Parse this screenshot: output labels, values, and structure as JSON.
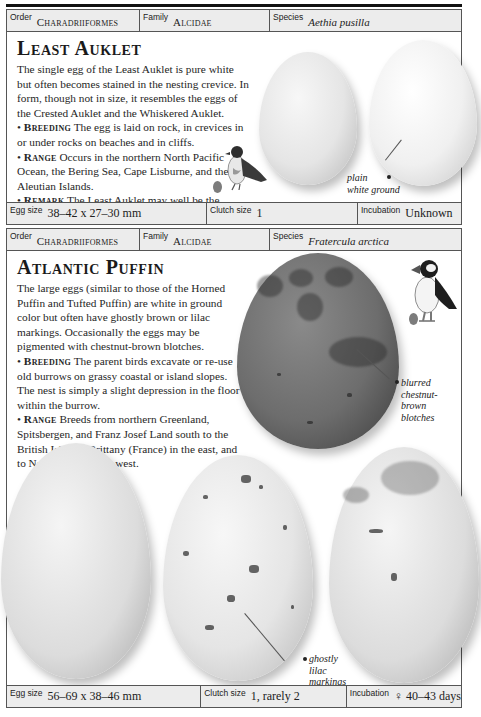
{
  "entries": [
    {
      "order_label": "Order",
      "order": "Charadriiformes",
      "family_label": "Family",
      "family": "Alcidae",
      "species_label": "Species",
      "species": "Aethia pusilla",
      "title": "Least Auklet",
      "intro": "The single egg of the Least Auklet is pure white but often becomes stained in the nesting crevice. In form, though not in size, it resembles the eggs of the Crested Auklet and the Whiskered Auklet.",
      "sections": [
        {
          "keyword": "Breeding",
          "text": "The egg is laid on rock, in crevices in or under rocks on beaches and in cliffs."
        },
        {
          "keyword": "Range",
          "text": "Occurs in the northern North Pacific Ocean, the Bering Sea, Cape Lisburne, and the Aleutian Islands."
        },
        {
          "keyword": "Remark",
          "text": "The Least Auklet may well be the smallest of all seabirds."
        }
      ],
      "annotations": [
        {
          "line1": "plain",
          "line2": "white ground"
        }
      ],
      "egg_size_label": "Egg size",
      "egg_size": "38–42 x 27–30 mm",
      "clutch_size_label": "Clutch size",
      "clutch_size": "1",
      "incubation_label": "Incubation",
      "incubation": "Unknown"
    },
    {
      "order_label": "Order",
      "order": "Charadriiformes",
      "family_label": "Family",
      "family": "Alcidae",
      "species_label": "Species",
      "species": "Fratercula arctica",
      "title": "Atlantic Puffin",
      "intro": "The large eggs (similar to those of the Horned Puffin and Tufted Puffin) are white in ground color but often have ghostly brown or lilac markings. Occasionally the eggs may be pigmented with chestnut-brown blotches.",
      "sections": [
        {
          "keyword": "Breeding",
          "text": "The parent birds excavate or re-use old burrows on grassy coastal or island slopes. The nest is simply a slight depression in the floor within the burrow."
        },
        {
          "keyword": "Range",
          "text": "Breeds from northern Greenland, Spitsbergen, and Franz Josef Land south to the British Isles, to Brittany (France) in the east, and to Nova Scotia in the west."
        }
      ],
      "annotations": [
        {
          "line1": "blurred",
          "line2": "chestnut-",
          "line3": "brown",
          "line4": "blotches"
        },
        {
          "line1": "ghostly",
          "line2": "lilac",
          "line3": "markings"
        }
      ],
      "egg_size_label": "Egg size",
      "egg_size": "56–69 x 38–46 mm",
      "clutch_size_label": "Clutch size",
      "clutch_size": "1, rarely 2",
      "incubation_label": "Incubation",
      "incubation": "♀ 40–43 days"
    }
  ],
  "icons": {
    "bird_1": "least-auklet-illustration",
    "bird_2": "atlantic-puffin-illustration",
    "bullet": "•"
  },
  "colors": {
    "meta_row_bg": "#ececec",
    "border": "#555555",
    "text": "#1e1e1e"
  }
}
